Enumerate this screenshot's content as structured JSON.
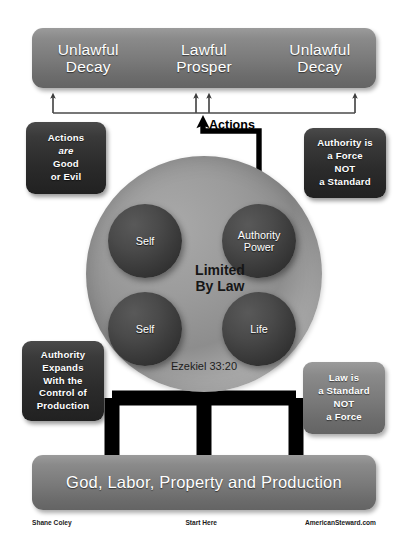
{
  "diagram": {
    "top_banner": {
      "left": {
        "line1": "Unlawful",
        "line2": "Decay"
      },
      "middle": {
        "line1": "Lawful",
        "line2": "Prosper"
      },
      "right": {
        "line1": "Unlawful",
        "line2": "Decay"
      }
    },
    "notes": {
      "actions_good_or_evil": {
        "line1": "Actions",
        "line2": "are",
        "line3": "Good",
        "line4": "or Evil"
      },
      "authority_is_a_force": {
        "line1": "Authority is",
        "line2": "a Force",
        "line3": "NOT",
        "line4": "a Standard"
      },
      "authority_expands": {
        "line1": "Authority",
        "line2": "Expands",
        "line3": "With the",
        "line4": "Control of",
        "line5": "Production"
      },
      "law_is_a_standard": {
        "line1": "Law is",
        "line2": "a Standard",
        "line3": "NOT",
        "line4": "a Force"
      }
    },
    "circle": {
      "center_label_line1": "Limited",
      "center_label_line2": "By Law",
      "scripture_reference": "Ezekiel 33:20",
      "nodes": {
        "self_top": {
          "line1": "Self",
          "line2": ""
        },
        "authority_power": {
          "line1": "Authority",
          "line2": "Power"
        },
        "self_bottom": {
          "line1": "Self",
          "line2": ""
        },
        "life": {
          "line1": "Life",
          "line2": ""
        }
      }
    },
    "actions_arrow_label": "Actions",
    "bottom_banner": {
      "label": "God, Labor, Property and Production"
    },
    "footer": {
      "author": "Shane Coley",
      "start_here": "Start Here",
      "website": "AmericanSteward.com"
    },
    "colors": {
      "banner_grey": "#7a7a7a",
      "note_dark": "#2f2f2f",
      "circle_grey": "#9c9c9c",
      "sphere_dark": "#393939",
      "connector_black": "#000000",
      "page_background": "#ffffff"
    }
  }
}
